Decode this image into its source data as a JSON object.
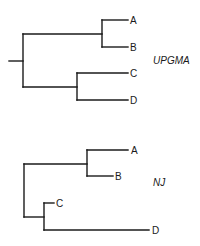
{
  "figure": {
    "trees": [
      {
        "id": "upgma",
        "method_label": "UPGMA",
        "taxa": [
          "A",
          "B",
          "C",
          "D"
        ],
        "topology": "((A,B),(C,D))",
        "rooted": true
      },
      {
        "id": "nj",
        "method_label": "NJ",
        "taxa": [
          "A",
          "B",
          "C",
          "D"
        ],
        "topology": "((A,B),(C,D))",
        "rooted": false
      }
    ]
  }
}
